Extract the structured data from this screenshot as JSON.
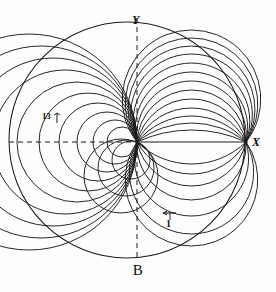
{
  "figure": {
    "caption": "B",
    "axis_labels": {
      "x": "X",
      "y": "Y"
    },
    "annotations": {
      "left_tick_label": "13",
      "bottom_arrow_label": "1"
    }
  },
  "chart_data": {
    "type": "line",
    "title": "B",
    "subtitle": "",
    "xlabel": "X",
    "ylabel": "Y",
    "grid": false,
    "legend": "none",
    "axes": {
      "x_axis": {
        "style_left_of_pole": "dashed",
        "style_right_of_pole": "solid",
        "x_from": 10,
        "x_to": 246,
        "y": 142
      },
      "y_axis": {
        "style": "dashed",
        "x": 137,
        "y_from": 18,
        "y_to": 259
      }
    },
    "pole": {
      "x": 137,
      "y": 142
    },
    "right_node": {
      "x": 246,
      "y": 142
    },
    "bounding_circle": {
      "cx": 127,
      "cy": 140,
      "r": 118
    },
    "series": [
      {
        "name": "circle-13",
        "index": 13,
        "sagitta_up": -112,
        "sagitta_down": 0
      },
      {
        "name": "circle-12",
        "index": 12,
        "sagitta_up": -104,
        "sagitta_down": 104
      },
      {
        "name": "circle-11",
        "index": 11,
        "sagitta_up": -96,
        "sagitta_down": 92
      },
      {
        "name": "circle-10",
        "index": 10,
        "sagitta_up": -88,
        "sagitta_down": 74
      },
      {
        "name": "circle-9",
        "index": 9,
        "sagitta_up": -79,
        "sagitta_down": 58
      },
      {
        "name": "circle-8",
        "index": 8,
        "sagitta_up": -70,
        "sagitta_down": 44
      },
      {
        "name": "circle-7",
        "index": 7,
        "sagitta_up": -61,
        "sagitta_down": 32
      },
      {
        "name": "circle-6",
        "index": 6,
        "sagitta_up": -52,
        "sagitta_down": 22
      },
      {
        "name": "circle-5",
        "index": 5,
        "sagitta_up": -43,
        "sagitta_down": 0
      },
      {
        "name": "circle-4",
        "index": 4,
        "sagitta_up": -34,
        "sagitta_down": 0
      },
      {
        "name": "circle-3",
        "index": 3,
        "sagitta_up": -26,
        "sagitta_down": 0
      },
      {
        "name": "circle-2",
        "index": 2,
        "sagitta_up": -19,
        "sagitta_down": 0
      },
      {
        "name": "circle-1",
        "index": 1,
        "sagitta_up": -12,
        "sagitta_down": 0
      }
    ],
    "x": [],
    "values": [],
    "categories": []
  },
  "style": {
    "stroke": "#1a1a1a",
    "background": "#fefefe",
    "axis_dash": "5,4"
  }
}
